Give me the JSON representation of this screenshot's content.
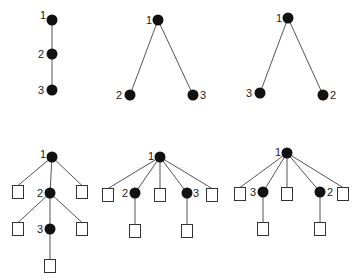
{
  "colors": {
    "node": "#111111",
    "edge": "#555555",
    "leaf_border": "#333333",
    "background": "#ffffff"
  },
  "graphs": [
    {
      "id": "a",
      "label": "chain 1-2-3",
      "nodes": [
        {
          "id": "1",
          "label": "1",
          "x": 52,
          "y": 20,
          "lx": 40,
          "ly": 19
        },
        {
          "id": "2",
          "label": "2",
          "x": 52,
          "y": 54,
          "lx": 38,
          "ly": 58
        },
        {
          "id": "3",
          "label": "3",
          "x": 52,
          "y": 90,
          "lx": 38,
          "ly": 94
        }
      ],
      "leaves": [],
      "edges": [
        [
          "1",
          "2"
        ],
        [
          "2",
          "3"
        ]
      ]
    },
    {
      "id": "b",
      "label": "tree 1 with children 2,3",
      "nodes": [
        {
          "id": "1",
          "label": "1",
          "x": 158,
          "y": 20,
          "lx": 146,
          "ly": 24
        },
        {
          "id": "2",
          "label": "2",
          "x": 130,
          "y": 95,
          "lx": 116,
          "ly": 99
        },
        {
          "id": "3",
          "label": "3",
          "x": 193,
          "y": 95,
          "lx": 200,
          "ly": 99
        }
      ],
      "leaves": [],
      "edges": [
        [
          "1",
          "2"
        ],
        [
          "1",
          "3"
        ]
      ]
    },
    {
      "id": "c",
      "label": "tree 1 with children 3,2",
      "nodes": [
        {
          "id": "1",
          "label": "1",
          "x": 288,
          "y": 18,
          "lx": 276,
          "ly": 22
        },
        {
          "id": "3",
          "label": "3",
          "x": 260,
          "y": 93,
          "lx": 246,
          "ly": 97
        },
        {
          "id": "2",
          "label": "2",
          "x": 323,
          "y": 95,
          "lx": 330,
          "ly": 99
        }
      ],
      "leaves": [],
      "edges": [
        [
          "1",
          "3"
        ],
        [
          "1",
          "2"
        ]
      ]
    },
    {
      "id": "d",
      "label": "extended chain",
      "nodes": [
        {
          "id": "1",
          "label": "1",
          "x": 52,
          "y": 157,
          "lx": 40,
          "ly": 158
        },
        {
          "id": "2",
          "label": "2",
          "x": 50,
          "y": 193,
          "lx": 37,
          "ly": 197
        },
        {
          "id": "3",
          "label": "3",
          "x": 50,
          "y": 229,
          "lx": 37,
          "ly": 233
        }
      ],
      "leaves": [
        {
          "id": "d1",
          "x": 18,
          "y": 191
        },
        {
          "id": "d2",
          "x": 82,
          "y": 191
        },
        {
          "id": "d3",
          "x": 18,
          "y": 228
        },
        {
          "id": "d4",
          "x": 82,
          "y": 228
        },
        {
          "id": "d5",
          "x": 50,
          "y": 265
        }
      ],
      "edges": [
        [
          "1",
          "2"
        ],
        [
          "1",
          "d1"
        ],
        [
          "1",
          "d2"
        ],
        [
          "2",
          "3"
        ],
        [
          "2",
          "d3"
        ],
        [
          "2",
          "d4"
        ],
        [
          "3",
          "d5"
        ]
      ]
    },
    {
      "id": "e",
      "label": "extended tree 1 with children 2,3",
      "nodes": [
        {
          "id": "1",
          "label": "1",
          "x": 160,
          "y": 157,
          "lx": 148,
          "ly": 160
        },
        {
          "id": "2",
          "label": "2",
          "x": 135,
          "y": 193,
          "lx": 122,
          "ly": 197
        },
        {
          "id": "3",
          "label": "3",
          "x": 187,
          "y": 193,
          "lx": 193,
          "ly": 197
        }
      ],
      "leaves": [
        {
          "id": "e1",
          "x": 108,
          "y": 194
        },
        {
          "id": "e2",
          "x": 160,
          "y": 194
        },
        {
          "id": "e3",
          "x": 212,
          "y": 194
        },
        {
          "id": "e4",
          "x": 135,
          "y": 230
        },
        {
          "id": "e5",
          "x": 187,
          "y": 230
        }
      ],
      "edges": [
        [
          "1",
          "e1"
        ],
        [
          "1",
          "2"
        ],
        [
          "1",
          "e2"
        ],
        [
          "1",
          "3"
        ],
        [
          "1",
          "e3"
        ],
        [
          "2",
          "e4"
        ],
        [
          "3",
          "e5"
        ]
      ]
    },
    {
      "id": "f",
      "label": "extended tree 1 with children 3,2",
      "nodes": [
        {
          "id": "1",
          "label": "1",
          "x": 287,
          "y": 153,
          "lx": 275,
          "ly": 156
        },
        {
          "id": "3",
          "label": "3",
          "x": 263,
          "y": 192,
          "lx": 250,
          "ly": 196
        },
        {
          "id": "2",
          "label": "2",
          "x": 320,
          "y": 192,
          "lx": 327,
          "ly": 196
        }
      ],
      "leaves": [
        {
          "id": "f1",
          "x": 240,
          "y": 193
        },
        {
          "id": "f2",
          "x": 287,
          "y": 193
        },
        {
          "id": "f3",
          "x": 343,
          "y": 193
        },
        {
          "id": "f4",
          "x": 263,
          "y": 228
        },
        {
          "id": "f5",
          "x": 320,
          "y": 228
        }
      ],
      "edges": [
        [
          "1",
          "f1"
        ],
        [
          "1",
          "3"
        ],
        [
          "1",
          "f2"
        ],
        [
          "1",
          "2"
        ],
        [
          "1",
          "f3"
        ],
        [
          "3",
          "f4"
        ],
        [
          "2",
          "f5"
        ]
      ]
    }
  ]
}
